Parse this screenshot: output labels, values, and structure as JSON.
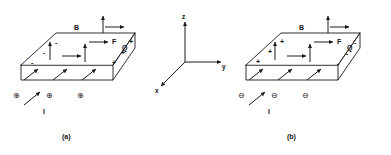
{
  "figure": {
    "stroke_color": "#1a1a1a",
    "background": "#ffffff"
  },
  "panels": [
    {
      "id": "a",
      "caption": "(a)",
      "carrier_sign": "positive",
      "field_label": "B",
      "force_label": "F",
      "charge_label": "Q",
      "current_label": "I",
      "edge_sign_left": "-",
      "edge_sign_right": "+",
      "carrier_glyph": "⊕",
      "left_edge_signs": [
        "-",
        "-",
        "-"
      ],
      "right_edge_signs": [
        "+",
        "+",
        "+"
      ],
      "carriers": [
        "⊕",
        "⊕",
        "⊕"
      ]
    },
    {
      "id": "b",
      "caption": "(b)",
      "carrier_sign": "negative",
      "field_label": "B",
      "force_label": "F",
      "charge_label": "Q",
      "current_label": "I",
      "edge_sign_left": "+",
      "edge_sign_right": "-",
      "carrier_glyph": "⊖",
      "left_edge_signs": [
        "+",
        "+",
        "+"
      ],
      "right_edge_signs": [
        "-",
        "-",
        "-"
      ],
      "carriers": [
        "⊖",
        "⊖",
        "⊖"
      ]
    }
  ],
  "axes": {
    "z_label": "z",
    "y_label": "y",
    "x_label": "x"
  }
}
